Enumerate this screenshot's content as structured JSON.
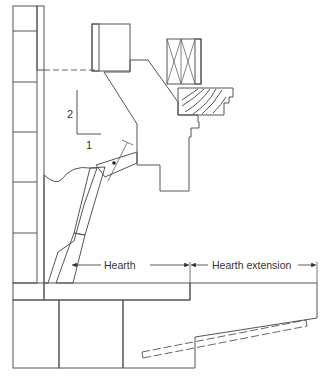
{
  "diagram": {
    "colors": {
      "line": "#555555",
      "hatch": "#8a8a8a",
      "gray_fill": "#c8c8c8",
      "stipple": "#f2f2f2",
      "background": "#ffffff"
    },
    "slope_indicator": {
      "rise_label": "2",
      "run_label": "1"
    },
    "dimensions": {
      "hearth_label": "Hearth",
      "hearth_extension_label": "Hearth extension"
    },
    "components": [
      "brick-chimney-wall",
      "flue-liner",
      "lintel-block",
      "stud-wall",
      "wood-mantel",
      "fireplace-breast",
      "damper",
      "smoke-shelf-fill",
      "firebox-back-wall",
      "hearth-slab",
      "foundation",
      "hearth-extension-slab",
      "reinforcement-bar"
    ]
  }
}
